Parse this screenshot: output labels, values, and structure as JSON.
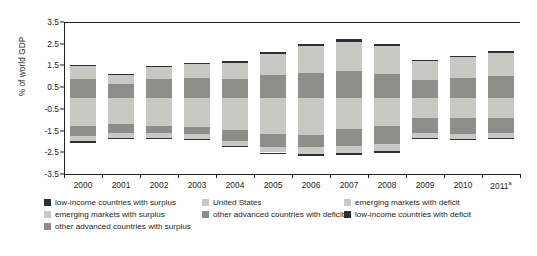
{
  "chart_data": {
    "type": "bar",
    "subtype": "stacked-diverging",
    "title": "",
    "xlabel": "",
    "ylabel": "% of world GDP",
    "ylim": [
      -3.5,
      3.5
    ],
    "yticks": [
      3.5,
      2.5,
      1.5,
      0.5,
      -0.5,
      -1.5,
      -2.5,
      -3.5
    ],
    "ytick_labels": [
      "3.5",
      "2.5",
      "1.5",
      "0.5",
      "-0.5",
      "-1.5",
      "-2.5",
      "-3.5"
    ],
    "grid": false,
    "zero_line": true,
    "legend_position": "bottom",
    "categories": [
      "2000",
      "2001",
      "2002",
      "2003",
      "2004",
      "2005",
      "2006",
      "2007",
      "2008",
      "2009",
      "2010",
      "2011"
    ],
    "category_labels": [
      "2000",
      "2001",
      "2002",
      "2003",
      "2004",
      "2005",
      "2006",
      "2007",
      "2008",
      "2009",
      "2010",
      "2011",
      "2011a"
    ],
    "last_category_note": "a",
    "series": [
      {
        "name": "low-income countries with surplus",
        "color": "#2b2f3a",
        "side": "surplus",
        "order": 3,
        "values": [
          0.04,
          0.04,
          0.05,
          0.05,
          0.07,
          0.09,
          0.11,
          0.12,
          0.11,
          0.05,
          0.06,
          0.07
        ]
      },
      {
        "name": "emerging markets with surplus",
        "color": "#c9c9c4",
        "side": "surplus",
        "order": 2,
        "values": [
          0.58,
          0.4,
          0.53,
          0.62,
          0.75,
          0.95,
          1.25,
          1.35,
          1.3,
          0.85,
          0.95,
          1.05
        ]
      },
      {
        "name": "other advanced countries with surplus",
        "color": "#8d8d89",
        "side": "surplus",
        "order": 1,
        "values": [
          0.88,
          0.66,
          0.88,
          0.93,
          0.88,
          1.06,
          1.14,
          1.23,
          1.09,
          0.85,
          0.93,
          1.03
        ]
      },
      {
        "name": "United States",
        "color": "#c9c9c4",
        "side": "deficit",
        "order": 1,
        "values": [
          -1.28,
          -1.22,
          -1.28,
          -1.33,
          -1.47,
          -1.68,
          -1.72,
          -1.45,
          -1.27,
          -0.9,
          -0.94,
          -0.93
        ]
      },
      {
        "name": "other advanced countries with deficit",
        "color": "#8d8d89",
        "side": "deficit",
        "order": 2,
        "values": [
          -0.45,
          -0.41,
          -0.35,
          -0.35,
          -0.5,
          -0.58,
          -0.55,
          -0.78,
          -0.86,
          -0.72,
          -0.73,
          -0.7
        ]
      },
      {
        "name": "emerging markets with deficit",
        "color": "#c9c9c4",
        "side": "deficit",
        "order": 3,
        "values": [
          -0.27,
          -0.22,
          -0.22,
          -0.2,
          -0.22,
          -0.25,
          -0.3,
          -0.3,
          -0.33,
          -0.23,
          -0.2,
          -0.2
        ]
      },
      {
        "name": "low-income countries with deficit",
        "color": "#2b2f3a",
        "side": "deficit",
        "order": 4,
        "values": [
          -0.05,
          -0.05,
          -0.05,
          -0.05,
          -0.06,
          -0.07,
          -0.08,
          -0.08,
          -0.09,
          -0.06,
          -0.06,
          -0.06
        ]
      }
    ],
    "annotations": []
  },
  "legend": {
    "items": [
      {
        "label": "low-income countries with surplus",
        "color": "#2b2f3a",
        "col": 0,
        "row": 0
      },
      {
        "label": "emerging markets with surplus",
        "color": "#c9c9c4",
        "col": 0,
        "row": 1
      },
      {
        "label": "other advanced countries with surplus",
        "color": "#8d8d89",
        "col": 0,
        "row": 2
      },
      {
        "label": "United States",
        "color": "#c9c9c4",
        "col": 1,
        "row": 0
      },
      {
        "label": "other advanced countries with deficit",
        "color": "#8d8d89",
        "col": 1,
        "row": 1
      },
      {
        "label": "emerging markets with deficit",
        "color": "#c9c9c4",
        "col": 2,
        "row": 0
      },
      {
        "label": "low-income countries with deficit",
        "color": "#2b2f3a",
        "col": 2,
        "row": 1
      }
    ]
  },
  "colors": {
    "dark": "#2b2f3a",
    "mid": "#8d8d89",
    "light": "#c9c9c4",
    "axis": "#231f20",
    "background": "#ffffff",
    "bar_gap": "#ffffff"
  }
}
